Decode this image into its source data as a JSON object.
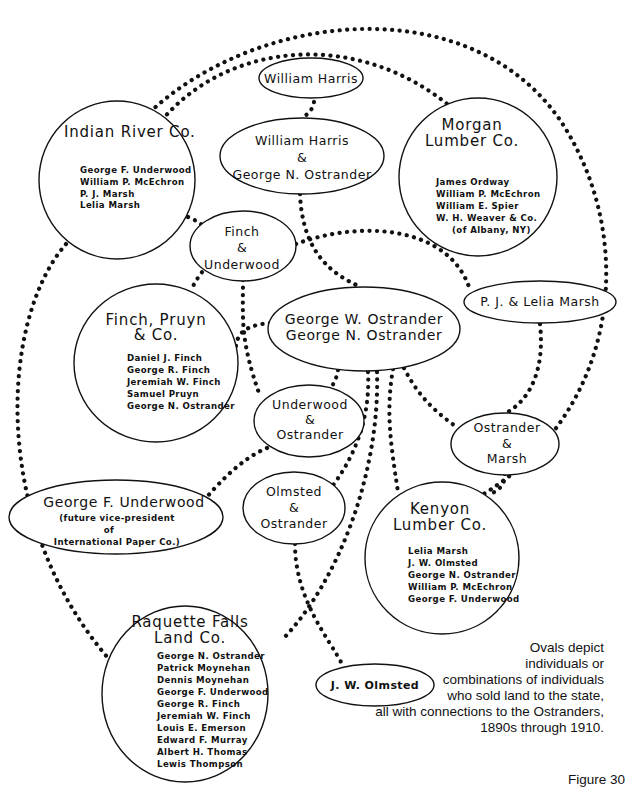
{
  "diagram": {
    "nodes": {
      "indian_river": {
        "title": "Indian River Co.",
        "members": [
          "George F. Underwood",
          "William P. McEchron",
          "P. J. Marsh",
          "Lelia Marsh"
        ]
      },
      "william_harris": {
        "title": "William Harris"
      },
      "harris_ostrander": {
        "lines": [
          "William Harris",
          "&",
          "George N. Ostrander"
        ]
      },
      "morgan_lumber": {
        "title_lines": [
          "Morgan",
          "Lumber Co."
        ],
        "members": [
          "James Ordway",
          "William P. McEchron",
          "William E. Spier",
          "W. H. Weaver & Co.",
          "(of Albany, NY)"
        ]
      },
      "finch_underwood": {
        "lines": [
          "Finch",
          "&",
          "Underwood"
        ]
      },
      "finch_pruyn": {
        "title_lines": [
          "Finch, Pruyn",
          "& Co."
        ],
        "members": [
          "Daniel J. Finch",
          "George R. Finch",
          "Jeremiah W. Finch",
          "Samuel Pruyn",
          "George N. Ostrander"
        ]
      },
      "ostranders": {
        "lines": [
          "George W. Ostrander",
          "George N. Ostrander"
        ]
      },
      "pj_lelia_marsh": {
        "title": "P. J. & Lelia Marsh"
      },
      "underwood_ostrander": {
        "lines": [
          "Underwood",
          "&",
          "Ostrander"
        ]
      },
      "ostrander_marsh": {
        "lines": [
          "Ostrander",
          "&",
          "Marsh"
        ]
      },
      "george_underwood": {
        "title": "George F. Underwood",
        "notes": [
          "(future vice-president",
          "of",
          "International Paper Co.)"
        ]
      },
      "olmsted_ostrander": {
        "lines": [
          "Olmsted",
          "&",
          "Ostrander"
        ]
      },
      "kenyon_lumber": {
        "title_lines": [
          "Kenyon",
          "Lumber Co."
        ],
        "members": [
          "Lelia Marsh",
          "J. W. Olmsted",
          "George N. Ostrander",
          "William P. McEchron",
          "George F. Underwood"
        ]
      },
      "raquette_falls": {
        "title_lines": [
          "Raquette Falls",
          "Land Co."
        ],
        "members": [
          "George N. Ostrander",
          "Patrick Moynehan",
          "Dennis Moynehan",
          "George F. Underwood",
          "George R. Finch",
          "Jeremiah W. Finch",
          "Louis E. Emerson",
          "Edward F. Murray",
          "Albert H. Thomas",
          "Lewis Thompson"
        ]
      },
      "jw_olmsted": {
        "title": "J. W. Olmsted"
      }
    },
    "connections": [
      [
        "indian_river",
        "morgan_lumber"
      ],
      [
        "indian_river",
        "kenyon_lumber"
      ],
      [
        "indian_river",
        "finch_underwood"
      ],
      [
        "indian_river",
        "raquette_falls"
      ],
      [
        "william_harris",
        "harris_ostrander"
      ],
      [
        "harris_ostrander",
        "ostranders"
      ],
      [
        "finch_underwood",
        "pj_lelia_marsh"
      ],
      [
        "finch_underwood",
        "underwood_ostrander"
      ],
      [
        "finch_underwood",
        "finch_pruyn"
      ],
      [
        "finch_pruyn",
        "ostranders"
      ],
      [
        "ostranders",
        "underwood_ostrander"
      ],
      [
        "ostranders",
        "ostrander_marsh"
      ],
      [
        "ostranders",
        "olmsted_ostrander"
      ],
      [
        "ostranders",
        "kenyon_lumber"
      ],
      [
        "ostranders",
        "raquette_falls"
      ],
      [
        "ostranders",
        "jw_olmsted"
      ],
      [
        "pj_lelia_marsh",
        "ostrander_marsh"
      ],
      [
        "ostrander_marsh",
        "kenyon_lumber"
      ],
      [
        "underwood_ostrander",
        "george_underwood"
      ],
      [
        "olmsted_ostrander",
        "jw_olmsted"
      ]
    ]
  },
  "caption": {
    "lines": [
      "Ovals depict",
      "individuals or",
      "combinations of individuals",
      "who sold land to the state,",
      "all with connections to the Ostranders,",
      "1890s through 1910."
    ]
  },
  "figure_label": "Figure 30"
}
